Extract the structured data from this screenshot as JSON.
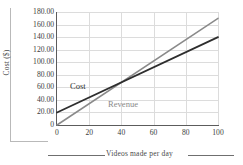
{
  "chart_data": {
    "type": "line",
    "title": "",
    "xlabel": "Videos made per day",
    "ylabel": "Cost ($)",
    "xlim": [
      0,
      100
    ],
    "ylim": [
      0,
      180
    ],
    "grid": true,
    "legend_position": "inline-annotations",
    "x_ticks": [
      0,
      20,
      40,
      60,
      80,
      100
    ],
    "x_tick_labels": [
      "0",
      "20",
      "40",
      "60",
      "80",
      "100"
    ],
    "y_ticks": [
      0,
      20,
      40,
      60,
      80,
      100,
      120,
      140,
      160,
      180
    ],
    "y_tick_labels": [
      "0",
      "20.00",
      "40.00",
      "60.00",
      "80.00",
      "100.00",
      "120.00",
      "140.00",
      "160.00",
      "180.00"
    ],
    "x": [
      0,
      100
    ],
    "series": [
      {
        "name": "Cost",
        "values": [
          20,
          140
        ],
        "color": "#2e2e2e",
        "intercept": 20,
        "slope": 1.2,
        "annotation": "Cost"
      },
      {
        "name": "Revenue",
        "values": [
          0,
          170
        ],
        "color": "#8a8a8a",
        "intercept": 0,
        "slope": 1.7,
        "annotation": "Revenue"
      }
    ],
    "annotations": [
      {
        "text": "Cost",
        "x": 8,
        "y": 62
      },
      {
        "text": "Revenue",
        "x": 32,
        "y": 34
      }
    ],
    "intersection": {
      "x": 40,
      "y": 68
    }
  },
  "axes": {
    "y_title": "Cost ($)",
    "x_title": "Videos made per day"
  },
  "colors": {
    "cost_line": "#2e2e2e",
    "revenue_line": "#8a8a8a",
    "grid": "#dcdcdc",
    "axis": "#5c5c5c",
    "rule": "#b9b9b9",
    "background": "#ffffff"
  }
}
